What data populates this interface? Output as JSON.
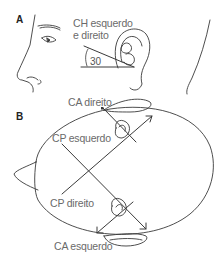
{
  "panels": {
    "a": {
      "label": "A"
    },
    "b": {
      "label": "B"
    }
  },
  "panel_a": {
    "canal_label_line1": "CH esquerdo",
    "canal_label_line2": "e direito",
    "angle": "30"
  },
  "panel_b": {
    "labels": {
      "ca_right": "CA direito",
      "cp_left": "CP esquerdo",
      "cp_right": "CP direito",
      "ca_left": "CA esquerdo"
    }
  },
  "colors": {
    "line": "#3a3a3a",
    "text": "#6a6a6a"
  }
}
